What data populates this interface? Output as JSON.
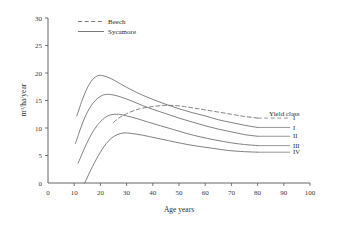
{
  "chart_data": {
    "type": "line",
    "title": "",
    "xlabel": "Age years",
    "ylabel": "m3/ha/year",
    "ylabel_display": "m³/ha/year",
    "xlim": [
      0,
      100
    ],
    "ylim": [
      0,
      30
    ],
    "xticks": [
      "0",
      "10",
      "20",
      "30",
      "40",
      "50",
      "60",
      "70",
      "80",
      "90",
      "100"
    ],
    "yticks": [
      "0",
      "5",
      "10",
      "15",
      "20",
      "25",
      "30"
    ],
    "grid": false,
    "legend_position": "top-left-inside",
    "legend": [
      {
        "name": "Beech",
        "style": "dashed"
      },
      {
        "name": "Sycamore",
        "style": "solid"
      }
    ],
    "annotations": [
      {
        "text": "Yield class",
        "x": 88,
        "y": 14.6
      }
    ],
    "series": [
      {
        "name": "Beech yield class I",
        "species": "Beech",
        "yield_class": "I",
        "style": "dashed",
        "color": "#6a6a6a",
        "end_label": "I",
        "points": [
          [
            25.0,
            11.0
          ],
          [
            27.0,
            11.8
          ],
          [
            30.0,
            12.6
          ],
          [
            33.0,
            13.2
          ],
          [
            36.0,
            13.6
          ],
          [
            40.0,
            13.9
          ],
          [
            44.0,
            14.1
          ],
          [
            48.0,
            14.1
          ],
          [
            52.0,
            13.9
          ],
          [
            56.0,
            13.6
          ],
          [
            60.0,
            13.3
          ],
          [
            65.0,
            12.9
          ],
          [
            70.0,
            12.5
          ],
          [
            75.0,
            12.1
          ],
          [
            80.0,
            11.8
          ]
        ]
      },
      {
        "name": "Sycamore yield class I (upper)",
        "species": "Sycamore",
        "yield_class": "I",
        "style": "solid",
        "color": "#6a6a6a",
        "end_label": "I",
        "points": [
          [
            11.0,
            12.2
          ],
          [
            13.0,
            15.0
          ],
          [
            15.0,
            17.3
          ],
          [
            17.0,
            18.8
          ],
          [
            19.0,
            19.5
          ],
          [
            21.0,
            19.5
          ],
          [
            24.0,
            19.0
          ],
          [
            27.0,
            18.2
          ],
          [
            30.0,
            17.4
          ],
          [
            35.0,
            16.2
          ],
          [
            40.0,
            15.2
          ],
          [
            45.0,
            14.3
          ],
          [
            50.0,
            13.5
          ],
          [
            55.0,
            12.8
          ],
          [
            60.0,
            12.2
          ],
          [
            65.0,
            11.5
          ],
          [
            70.0,
            11.0
          ],
          [
            75.0,
            10.5
          ],
          [
            80.0,
            10.1
          ]
        ]
      },
      {
        "name": "Sycamore yield class II",
        "species": "Sycamore",
        "yield_class": "II",
        "style": "solid",
        "color": "#6a6a6a",
        "end_label": "II",
        "points": [
          [
            10.5,
            7.2
          ],
          [
            12.5,
            10.0
          ],
          [
            14.5,
            12.4
          ],
          [
            17.0,
            14.4
          ],
          [
            19.5,
            15.6
          ],
          [
            22.0,
            16.1
          ],
          [
            25.0,
            16.0
          ],
          [
            28.0,
            15.6
          ],
          [
            32.0,
            14.9
          ],
          [
            36.0,
            14.1
          ],
          [
            40.0,
            13.4
          ],
          [
            45.0,
            12.6
          ],
          [
            50.0,
            11.8
          ],
          [
            55.0,
            11.1
          ],
          [
            60.0,
            10.4
          ],
          [
            65.0,
            9.8
          ],
          [
            70.0,
            9.3
          ],
          [
            75.0,
            8.8
          ],
          [
            80.0,
            8.5
          ]
        ]
      },
      {
        "name": "Sycamore yield class III",
        "species": "Sycamore",
        "yield_class": "III",
        "style": "solid",
        "color": "#6a6a6a",
        "end_label": "III",
        "points": [
          [
            11.5,
            3.6
          ],
          [
            14.0,
            6.4
          ],
          [
            16.5,
            8.8
          ],
          [
            19.0,
            10.6
          ],
          [
            21.5,
            11.8
          ],
          [
            24.0,
            12.4
          ],
          [
            27.0,
            12.5
          ],
          [
            30.0,
            12.2
          ],
          [
            34.0,
            11.7
          ],
          [
            38.0,
            11.1
          ],
          [
            43.0,
            10.4
          ],
          [
            48.0,
            9.7
          ],
          [
            53.0,
            9.0
          ],
          [
            58.0,
            8.4
          ],
          [
            64.0,
            7.8
          ],
          [
            70.0,
            7.3
          ],
          [
            75.0,
            7.0
          ],
          [
            80.0,
            6.8
          ]
        ]
      },
      {
        "name": "Sycamore yield class IV",
        "species": "Sycamore",
        "yield_class": "IV",
        "style": "solid",
        "color": "#6a6a6a",
        "end_label": "IV",
        "points": [
          [
            14.0,
            0.0
          ],
          [
            17.0,
            3.0
          ],
          [
            20.0,
            5.6
          ],
          [
            23.0,
            7.6
          ],
          [
            26.0,
            8.7
          ],
          [
            29.0,
            9.1
          ],
          [
            32.0,
            9.0
          ],
          [
            36.0,
            8.7
          ],
          [
            41.0,
            8.2
          ],
          [
            46.0,
            7.7
          ],
          [
            51.0,
            7.2
          ],
          [
            57.0,
            6.7
          ],
          [
            63.0,
            6.3
          ],
          [
            69.0,
            5.9
          ],
          [
            75.0,
            5.7
          ],
          [
            80.0,
            5.6
          ]
        ]
      }
    ]
  },
  "axes": {
    "x_title": "Age years",
    "y_title_main": "m",
    "y_title_sup": "3",
    "y_title_rest": "/ha/year"
  },
  "legend": {
    "beech": "Beech",
    "sycamore": "Sycamore"
  },
  "yield_class_block": {
    "heading": "Yield class",
    "labels": [
      "I",
      "I",
      "II",
      "III",
      "IV"
    ]
  },
  "colors": {
    "axis": "#555555",
    "curve": "#6a6a6a",
    "text": "#2b2b2b",
    "background": "#ffffff"
  }
}
